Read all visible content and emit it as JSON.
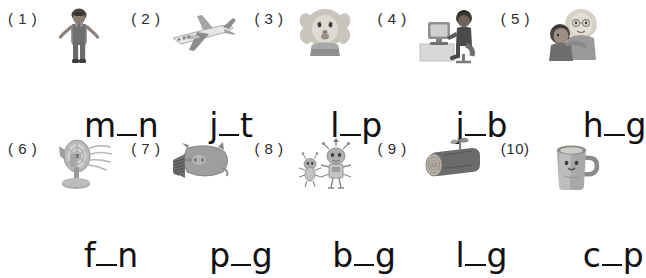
{
  "worksheet": {
    "background_color": "#ffffff",
    "ink_color": "#111111",
    "rows": 2,
    "columns": 5,
    "item_count": 10
  },
  "items": [
    {
      "number": "( 1 )",
      "picture": "man-icon",
      "picture_description": "man standing in overalls",
      "prefix": "m",
      "blank": "_",
      "suffix": "n",
      "word_display": "m_n",
      "answer_letter": "a"
    },
    {
      "number": "( 2 )",
      "picture": "jet-icon",
      "picture_description": "jet airplane in flight",
      "prefix": "j",
      "blank": "_",
      "suffix": "t",
      "word_display": "j_t",
      "answer_letter": "e"
    },
    {
      "number": "( 3 )",
      "picture": "lion-face-icon",
      "picture_description": "cartoon lion head with lips",
      "prefix": "l",
      "blank": "_",
      "suffix": "p",
      "word_display": "l_p",
      "answer_letter": "i"
    },
    {
      "number": "( 4 )",
      "picture": "office-worker-icon",
      "picture_description": "person working at a desk with computer",
      "prefix": "j",
      "blank": "_",
      "suffix": "b",
      "word_display": "j_b",
      "answer_letter": "o"
    },
    {
      "number": "( 5 )",
      "picture": "hug-icon",
      "picture_description": "two people hugging",
      "prefix": "h",
      "blank": "_",
      "suffix": "g",
      "word_display": "h_g",
      "answer_letter": "u"
    },
    {
      "number": "( 6 )",
      "picture": "fan-icon",
      "picture_description": "electric table fan blowing air",
      "prefix": "f",
      "blank": "_",
      "suffix": "n",
      "word_display": "f_n",
      "answer_letter": "a"
    },
    {
      "number": "( 7 )",
      "picture": "pig-icon",
      "picture_description": "pig seen from the side",
      "prefix": "p",
      "blank": "_",
      "suffix": "g",
      "word_display": "p_g",
      "answer_letter": "i"
    },
    {
      "number": "( 8 )",
      "picture": "bugs-icon",
      "picture_description": "two cartoon bugs standing",
      "prefix": "b",
      "blank": "_",
      "suffix": "g",
      "word_display": "b_g",
      "answer_letter": "u"
    },
    {
      "number": "( 9 )",
      "picture": "log-icon",
      "picture_description": "wooden log with a sprout",
      "prefix": "l",
      "blank": "_",
      "suffix": "g",
      "word_display": "l_g",
      "answer_letter": "o"
    },
    {
      "number": "(10)",
      "picture": "cup-icon",
      "picture_description": "mug with a face on it",
      "prefix": "c",
      "blank": "_",
      "suffix": "p",
      "word_display": "c_p",
      "answer_letter": "u"
    }
  ]
}
